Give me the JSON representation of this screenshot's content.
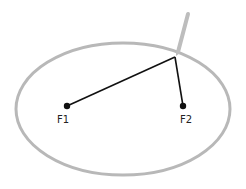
{
  "diagram": {
    "colors": {
      "ellipse": "#b8b8b8",
      "string": "#111111",
      "focus": "#111111",
      "pencil": "#bdbdbd",
      "label": "#222222"
    },
    "ellipse": {
      "cx": 123,
      "cy": 109,
      "rx": 107,
      "ry": 66
    },
    "foci": [
      {
        "id": "F1",
        "label": "F1",
        "x": 67,
        "y": 106
      },
      {
        "id": "F2",
        "label": "F2",
        "x": 183,
        "y": 106
      }
    ],
    "apex": {
      "x": 175,
      "y": 57
    },
    "pencil": {
      "x1": 188,
      "y1": 14,
      "x2": 178,
      "y2": 52
    }
  }
}
